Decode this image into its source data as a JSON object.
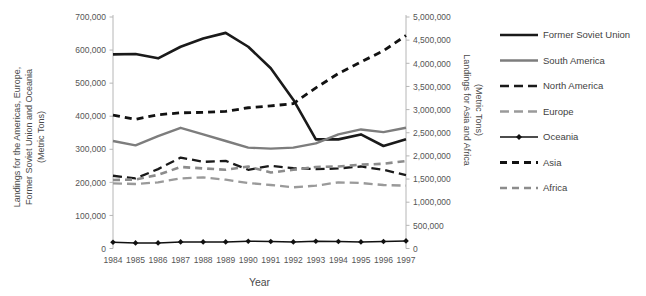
{
  "chart_data": {
    "type": "line",
    "title": "",
    "xlabel": "Year",
    "ylabel": "Landings for the Americas, Europe, Former Soviet Union and Oceania (Metric Tons)",
    "ylabel_line1": "Landings for the Americas, Europe,",
    "ylabel_line2": "Former Soviet Union and Oceania",
    "ylabel_line3": "(Metric Tons)",
    "y2label": "Landings for Asia and Africa",
    "y2label_line2": "(Metric Tons)",
    "grid": false,
    "legend_position": "right",
    "categories": [
      "1984",
      "1985",
      "1986",
      "1987",
      "1988",
      "1989",
      "1990",
      "1991",
      "1992",
      "1993",
      "1994",
      "1995",
      "1996",
      "1997"
    ],
    "ylim": [
      0,
      700000
    ],
    "y2lim": [
      0,
      5000000
    ],
    "yticks": [
      "0",
      "100,000",
      "200,000",
      "300,000",
      "400,000",
      "500,000",
      "600,000",
      "700,000"
    ],
    "ytick_values": [
      0,
      100000,
      200000,
      300000,
      400000,
      500000,
      600000,
      700000
    ],
    "y2ticks": [
      "0",
      "500,000",
      "1,000,000",
      "1,500,000",
      "2,000,000",
      "2,500,000",
      "3,000,000",
      "3,500,000",
      "4,000,000",
      "4,500,000",
      "5,000,000"
    ],
    "y2tick_values": [
      0,
      500000,
      1000000,
      1500000,
      2000000,
      2500000,
      3000000,
      3500000,
      4000000,
      4500000,
      5000000
    ],
    "series": [
      {
        "name": "Former Soviet Union",
        "axis": "left",
        "style": "solid",
        "color": "#1a1a1a",
        "width": 2.6,
        "marker": "none",
        "values": [
          587000,
          588000,
          575000,
          610000,
          635000,
          652000,
          610000,
          545000,
          450000,
          330000,
          330000,
          345000,
          310000,
          330000
        ]
      },
      {
        "name": "South America",
        "axis": "left",
        "style": "solid",
        "color": "#7d7d7d",
        "width": 2.4,
        "marker": "none",
        "values": [
          325000,
          312000,
          340000,
          365000,
          345000,
          325000,
          305000,
          302000,
          305000,
          318000,
          345000,
          360000,
          352000,
          365000
        ]
      },
      {
        "name": "North America",
        "axis": "left",
        "style": "dashed",
        "color": "#1a1a1a",
        "width": 2.3,
        "marker": "none",
        "values": [
          220000,
          212000,
          240000,
          275000,
          262000,
          265000,
          238000,
          250000,
          243000,
          240000,
          242000,
          248000,
          238000,
          222000
        ]
      },
      {
        "name": "Europe",
        "axis": "left",
        "style": "dashed",
        "color": "#9a9a9a",
        "width": 2.3,
        "marker": "none",
        "values": [
          197000,
          195000,
          200000,
          212000,
          215000,
          208000,
          198000,
          192000,
          185000,
          190000,
          200000,
          198000,
          192000,
          190000
        ]
      },
      {
        "name": "Oceania",
        "axis": "left",
        "style": "solid",
        "color": "#111111",
        "width": 1.5,
        "marker": "diamond",
        "values": [
          19000,
          17000,
          17000,
          20000,
          20000,
          20000,
          22000,
          21000,
          20000,
          22000,
          21000,
          20000,
          21000,
          23000
        ]
      },
      {
        "name": "Asia",
        "axis": "right",
        "style": "dotted-dash",
        "color": "#121212",
        "width": 2.8,
        "marker": "none",
        "values": [
          2880000,
          2790000,
          2890000,
          2930000,
          2940000,
          2960000,
          3040000,
          3080000,
          3130000,
          3470000,
          3780000,
          4030000,
          4270000,
          4600000
        ]
      },
      {
        "name": "Africa",
        "axis": "right",
        "style": "dotted-dash",
        "color": "#8c8c8c",
        "width": 2.6,
        "marker": "none",
        "values": [
          1480000,
          1490000,
          1590000,
          1760000,
          1730000,
          1700000,
          1770000,
          1640000,
          1700000,
          1760000,
          1770000,
          1810000,
          1830000,
          1890000
        ]
      }
    ]
  },
  "legend": {
    "items": [
      {
        "label": "Former Soviet Union"
      },
      {
        "label": "South America"
      },
      {
        "label": "North America"
      },
      {
        "label": "Europe"
      },
      {
        "label": "Oceania"
      },
      {
        "label": "Asia"
      },
      {
        "label": "Africa"
      }
    ]
  }
}
